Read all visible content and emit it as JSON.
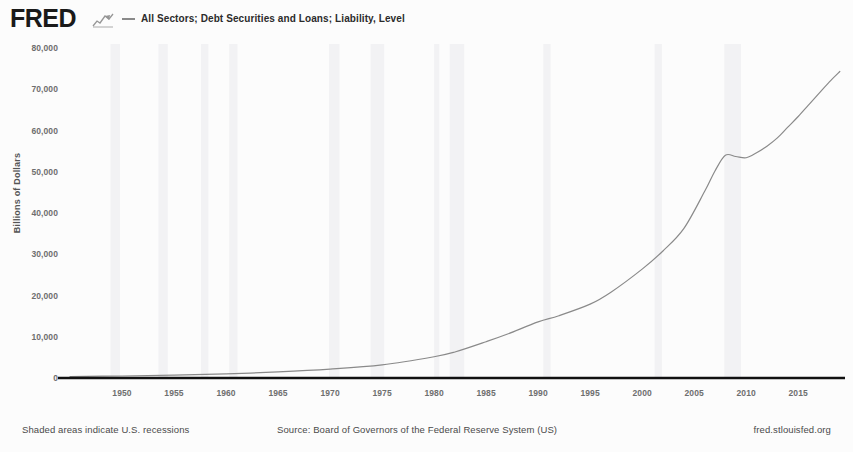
{
  "header": {
    "logo": "FRED",
    "logo_icon": "fred-chart-mark-icon",
    "legend_series_label": "All Sectors; Debt Securities and Loans; Liability, Level",
    "legend_swatch_icon": "line-swatch-icon"
  },
  "footer": {
    "recession_note": "Shaded areas indicate U.S. recessions",
    "source": "Source: Board of Governors of the Federal Reserve System (US)",
    "url": "fred.stlouisfed.org"
  },
  "colors": {
    "line": "#8a8a8a",
    "axis": "#111111",
    "recession_band": "#f2f2f4",
    "tick_text": "#6e6e6e",
    "background": "#fcfcfc"
  },
  "chart_data": {
    "type": "line",
    "title": "All Sectors; Debt Securities and Loans; Liability, Level",
    "xlabel": "",
    "ylabel": "Billions of Dollars",
    "xlim": [
      1945,
      2019.5
    ],
    "ylim": [
      0,
      80000
    ],
    "grid": false,
    "legend_position": "top",
    "ytick_labels": [
      "80,000",
      "70,000",
      "60,000",
      "50,000",
      "40,000",
      "30,000",
      "20,000",
      "10,000",
      "0"
    ],
    "ytick_values": [
      80000,
      70000,
      60000,
      50000,
      40000,
      30000,
      20000,
      10000,
      0
    ],
    "xtick_labels": [
      "1950",
      "1955",
      "1960",
      "1965",
      "1970",
      "1975",
      "1980",
      "1985",
      "1990",
      "1995",
      "2000",
      "2005",
      "2010",
      "2015"
    ],
    "xtick_values": [
      1950,
      1955,
      1960,
      1965,
      1970,
      1975,
      1980,
      1985,
      1990,
      1995,
      2000,
      2005,
      2010,
      2015
    ],
    "series": [
      {
        "name": "All Sectors; Debt Securities and Loans; Liability, Level",
        "color": "#8a8a8a",
        "x": [
          1945,
          1950,
          1955,
          1960,
          1965,
          1970,
          1975,
          1980,
          1982,
          1985,
          1987,
          1990,
          1992,
          1995,
          1997,
          2000,
          2002,
          2004,
          2006,
          2007,
          2008,
          2009,
          2010,
          2011,
          2012,
          2013,
          2014,
          2015,
          2016,
          2017,
          2018,
          2019
        ],
        "values": [
          355,
          490,
          720,
          1010,
          1470,
          2150,
          3180,
          5150,
          6300,
          8800,
          10600,
          13600,
          15100,
          17900,
          20800,
          26400,
          30800,
          36200,
          45200,
          50200,
          54000,
          53700,
          53400,
          54600,
          56200,
          58200,
          60800,
          63400,
          66200,
          69000,
          71800,
          74300
        ]
      }
    ],
    "recession_bands": [
      [
        1948.9,
        1949.8
      ],
      [
        1953.5,
        1954.4
      ],
      [
        1957.6,
        1958.3
      ],
      [
        1960.3,
        1961.1
      ],
      [
        1969.9,
        1970.9
      ],
      [
        1973.9,
        1975.2
      ],
      [
        1980.0,
        1980.5
      ],
      [
        1981.5,
        1982.9
      ],
      [
        1990.5,
        1991.2
      ],
      [
        2001.2,
        2001.9
      ],
      [
        2007.9,
        2009.5
      ]
    ]
  }
}
